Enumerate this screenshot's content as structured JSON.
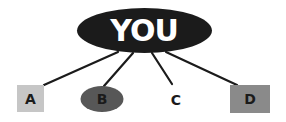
{
  "diagram": {
    "center": {
      "label": "YOU",
      "shape": "ellipse",
      "fill": "#1b1b1b",
      "text_color": "#ffffff"
    },
    "nodes": [
      {
        "id": "A",
        "label": "A",
        "shape": "square",
        "fill": "#c6c6c6",
        "text_color": "#1b1b1b"
      },
      {
        "id": "B",
        "label": "B",
        "shape": "ellipse",
        "fill": "#575757",
        "text_color": "#1b1b1b"
      },
      {
        "id": "C",
        "label": "C",
        "shape": "none",
        "fill": "none",
        "text_color": "#1b1b1b"
      },
      {
        "id": "D",
        "label": "D",
        "shape": "rectangle",
        "fill": "#8a8a8a",
        "text_color": "#1b1b1b"
      }
    ],
    "edges": [
      {
        "from": "YOU",
        "to": "A"
      },
      {
        "from": "YOU",
        "to": "B"
      },
      {
        "from": "YOU",
        "to": "C"
      },
      {
        "from": "YOU",
        "to": "D"
      }
    ],
    "line_color": "#1b1b1b"
  }
}
